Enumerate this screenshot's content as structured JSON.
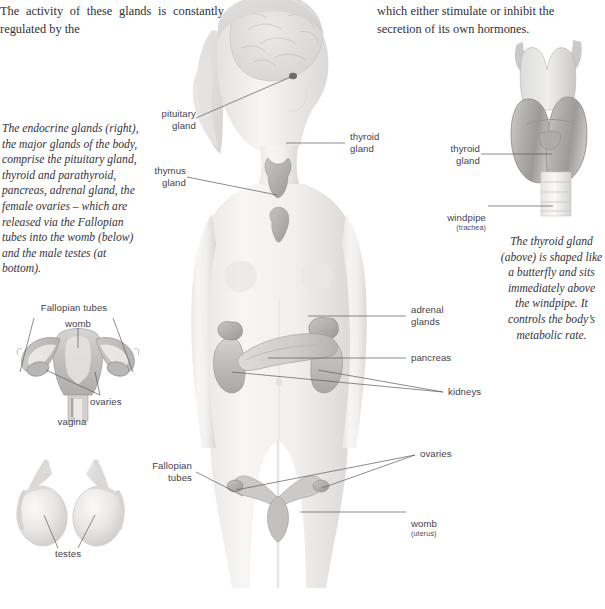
{
  "document": {
    "title": "The endocrine glands",
    "type": "anatomy-reference-page"
  },
  "body_text": {
    "left_column": "The activity of these glands is constantly regulated by the",
    "right_column_line1": "which either stimulate or inhibit the",
    "right_column_line2": "secretion of its own hormones."
  },
  "captions": {
    "endocrine": "The endocrine glands (right), the major glands of the body, comprise the pituitary gland, thyroid and parathyroid, pancreas, adrenal gland, the female ovaries – which are released via the Fallopian tubes into the womb (below) and the male testes (at bottom).",
    "thyroid": "The thyroid gland (above) is shaped like a butterfly and sits immediately above the windpipe. It controls the body’s metabolic rate."
  },
  "figures": {
    "female_body": {
      "name": "female-body-endocrine-figure",
      "labels": [
        {
          "id": "pituitary-gland",
          "text": "pituitary\ngland"
        },
        {
          "id": "thyroid-gland",
          "text": "thyroid\ngland"
        },
        {
          "id": "thymus-gland",
          "text": "thymus\ngland"
        },
        {
          "id": "adrenal-glands",
          "text": "adrenal\nglands"
        },
        {
          "id": "pancreas",
          "text": "pancreas"
        },
        {
          "id": "kidneys",
          "text": "kidneys"
        },
        {
          "id": "fallopian-tubes",
          "text": "Fallopian\ntubes"
        },
        {
          "id": "ovaries",
          "text": "ovaries"
        },
        {
          "id": "womb",
          "text": "womb",
          "sub": "(uterus)"
        }
      ]
    },
    "thyroid_detail": {
      "name": "thyroid-gland-detail-figure",
      "labels": [
        {
          "id": "thyroid-gland",
          "text": "thyroid\ngland"
        },
        {
          "id": "windpipe",
          "text": "windpipe",
          "sub": "(trachea)"
        }
      ]
    },
    "female_reproductive": {
      "name": "female-reproductive-figure",
      "labels": [
        {
          "id": "fallopian-tubes",
          "text": "Fallopian tubes"
        },
        {
          "id": "womb",
          "text": "womb"
        },
        {
          "id": "ovaries",
          "text": "ovaries"
        },
        {
          "id": "vagina",
          "text": "vagina"
        }
      ]
    },
    "testes": {
      "name": "testes-figure",
      "labels": [
        {
          "id": "testes",
          "text": "testes"
        }
      ]
    }
  },
  "colors": {
    "text": "#333035",
    "label": "#45434a",
    "leader_line": "#5a5a60",
    "skin_light": "#f2f0ee",
    "skin_shade": "#dedcda",
    "organ_gray": "#b9b8b6",
    "organ_dark": "#8e8d8c",
    "page_background": "#ffffff"
  }
}
